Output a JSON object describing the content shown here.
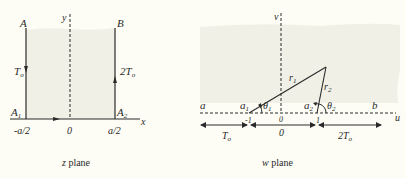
{
  "colors": {
    "background": "#fdfdf5",
    "shade": "#f0f0e6",
    "ink": "#2a2a2a"
  },
  "z_plane": {
    "caption_var": "z",
    "caption_text": " plane",
    "axis_x_label": "x",
    "axis_y_label": "y",
    "point_A": "A",
    "point_B": "B",
    "point_A1": "A",
    "point_A1_sub": "1",
    "point_A2": "A",
    "point_A2_sub": "2",
    "left_temp": "T",
    "left_temp_sub": "o",
    "right_temp": "2T",
    "right_temp_sub": "o",
    "tick_left": "-a/2",
    "tick_center": "0",
    "tick_right": "a/2"
  },
  "w_plane": {
    "caption_var": "w",
    "caption_text": " plane",
    "axis_u_label": "u",
    "axis_v_label": "v",
    "label_a": "a",
    "label_b": "b",
    "label_a1": "a",
    "label_a1_sub": "1",
    "label_a2": "a",
    "label_a2_sub": "2",
    "r1": "r",
    "r1_sub": "1",
    "r2": "r",
    "r2_sub": "2",
    "theta1": "θ",
    "theta1_sub": "1",
    "theta2": "θ",
    "theta2_sub": "2",
    "tick_neg1": "-1",
    "tick_0": "0",
    "tick_1": "1",
    "seg_left_temp": "T",
    "seg_left_temp_sub": "o",
    "seg_mid_value": "0",
    "seg_right_temp": "2T",
    "seg_right_temp_sub": "o"
  }
}
